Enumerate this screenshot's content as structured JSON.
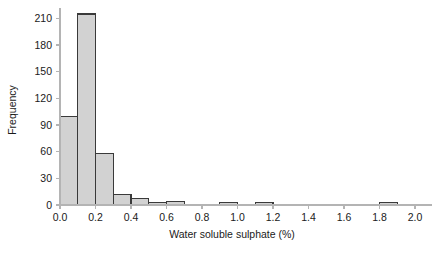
{
  "chart_data": {
    "type": "bar",
    "title": "",
    "subtitle": "",
    "xlabel": "Water soluble sulphate (%)",
    "ylabel": "Frequency",
    "xlim": [
      0.0,
      2.0
    ],
    "ylim": [
      0,
      220
    ],
    "bin_width": 0.1,
    "grid": false,
    "legend": null,
    "xticks": [
      "0.0",
      "0.2",
      "0.4",
      "0.6",
      "0.8",
      "1.0",
      "1.2",
      "1.4",
      "1.6",
      "1.8",
      "2.0"
    ],
    "xtick_values": [
      0.0,
      0.2,
      0.4,
      0.6,
      0.8,
      1.0,
      1.2,
      1.4,
      1.6,
      1.8,
      2.0
    ],
    "yticks": [
      "0",
      "30",
      "60",
      "90",
      "120",
      "150",
      "180",
      "210"
    ],
    "ytick_values": [
      0,
      30,
      60,
      90,
      120,
      150,
      180,
      210
    ],
    "bin_starts": [
      0.0,
      0.1,
      0.2,
      0.3,
      0.4,
      0.5,
      0.6,
      0.7,
      0.8,
      0.9,
      1.0,
      1.1,
      1.2,
      1.3,
      1.4,
      1.5,
      1.6,
      1.7,
      1.8,
      1.9
    ],
    "categories": [
      "0.0-0.1",
      "0.1-0.2",
      "0.2-0.3",
      "0.3-0.4",
      "0.4-0.5",
      "0.5-0.6",
      "0.6-0.7",
      "0.7-0.8",
      "0.8-0.9",
      "0.9-1.0",
      "1.0-1.1",
      "1.1-1.2",
      "1.2-1.3",
      "1.3-1.4",
      "1.4-1.5",
      "1.5-1.6",
      "1.6-1.7",
      "1.7-1.8",
      "1.8-1.9",
      "1.9-2.0"
    ],
    "values": [
      100,
      215,
      58,
      12,
      7,
      3,
      4,
      1,
      0,
      3,
      0,
      3,
      0,
      0,
      0,
      0,
      0,
      1,
      3,
      0
    ],
    "colors": {
      "bar_fill": "#d2d2d2",
      "bar_edge": "#3a3a3a",
      "axis": "#b4b4b4",
      "text": "#1a1a1a",
      "background": "#ffffff"
    }
  }
}
